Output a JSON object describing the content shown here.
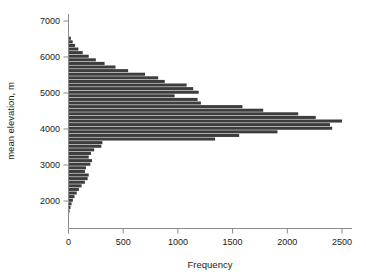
{
  "chart_data": {
    "type": "bar",
    "orientation": "horizontal",
    "title": "",
    "subtitle": "",
    "xlabel": "Frequency",
    "ylabel": "mean elevation, m",
    "xlim": [
      0,
      2620
    ],
    "ylim": [
      1620,
      7150
    ],
    "xticks": [
      0,
      500,
      1000,
      1500,
      2000,
      2500
    ],
    "xtick_labels": [
      "0",
      "500",
      "1000",
      "1500",
      "2000",
      "2500"
    ],
    "yticks": [
      2000,
      3000,
      4000,
      5000,
      6000,
      7000
    ],
    "ytick_labels": [
      "2000",
      "3000",
      "4000",
      "5000",
      "6000",
      "7000"
    ],
    "grid": false,
    "legend": null,
    "bin_width": 100,
    "bar_color": "#3d3d3d",
    "bar_edge_color": "#ffffff",
    "axis_color": "#8a8a8a",
    "categories": [
      1700,
      1800,
      1900,
      2000,
      2100,
      2200,
      2300,
      2400,
      2500,
      2600,
      2700,
      2800,
      2900,
      3000,
      3100,
      3200,
      3300,
      3400,
      3500,
      3600,
      3700,
      3800,
      3900,
      4000,
      4100,
      4200,
      4300,
      4400,
      4500,
      4600,
      4700,
      4800,
      4900,
      5000,
      5100,
      5200,
      5300,
      5400,
      5500,
      5600,
      5700,
      5800,
      5900,
      6000,
      6100,
      6200,
      6300,
      6400,
      6500
    ],
    "values": [
      10,
      18,
      28,
      40,
      55,
      75,
      95,
      120,
      150,
      175,
      185,
      150,
      160,
      200,
      215,
      185,
      205,
      235,
      300,
      310,
      1340,
      1560,
      1910,
      2410,
      2390,
      2500,
      2260,
      2100,
      1780,
      1590,
      1210,
      1180,
      970,
      1190,
      1140,
      1080,
      880,
      820,
      700,
      545,
      430,
      330,
      250,
      185,
      130,
      90,
      60,
      38,
      22
    ]
  },
  "axis": {
    "x_label_text": "Frequency",
    "y_label_text": "mean elevation, m"
  }
}
